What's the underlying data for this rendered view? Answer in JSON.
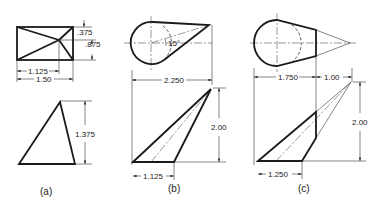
{
  "figure": {
    "panels": [
      {
        "id": "a",
        "label": "(a)",
        "top_view": {
          "dims": {
            "d1": ".375",
            "d2": ".875",
            "d3": "1.125",
            "d4": "1.50"
          }
        },
        "front_view": {
          "dims": {
            "height": "1.375"
          }
        }
      },
      {
        "id": "b",
        "label": "(b)",
        "top_view": {
          "angle": "15°",
          "dims": {
            "width": "2.250"
          }
        },
        "front_view": {
          "dims": {
            "height": "2.00",
            "base": "1.125"
          }
        }
      },
      {
        "id": "c",
        "label": "(c)",
        "top_view": {
          "dims": {
            "width1": "1.750",
            "width2": "1.00"
          }
        },
        "front_view": {
          "dims": {
            "height": "2.00",
            "base": "1.250"
          }
        }
      }
    ]
  }
}
